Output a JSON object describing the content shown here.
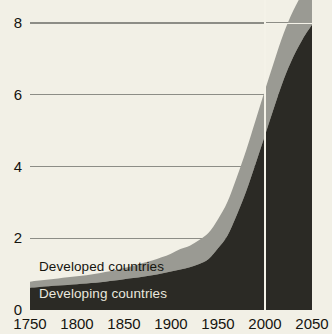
{
  "chart_data": {
    "type": "area",
    "stacked": true,
    "title": "",
    "subtitle": "",
    "xlabel": "",
    "ylabel": "",
    "xlim": [
      1750,
      2050
    ],
    "ylim": [
      0,
      8.7
    ],
    "grid": true,
    "grid_values": [
      2,
      4,
      6,
      8
    ],
    "legend_position": "inline",
    "xticks": [
      "1750",
      "1800",
      "1850",
      "1900",
      "1950",
      "2000",
      "2050"
    ],
    "xtick_values": [
      1750,
      1800,
      1850,
      1900,
      1950,
      2000,
      2050
    ],
    "yticks": [
      "0",
      "2",
      "4",
      "6",
      "8"
    ],
    "ytick_values": [
      0,
      2,
      4,
      6,
      8
    ],
    "annotation_line": {
      "x": 2000,
      "label": ""
    },
    "x": [
      1750,
      1760,
      1770,
      1780,
      1790,
      1800,
      1810,
      1820,
      1830,
      1840,
      1850,
      1860,
      1870,
      1880,
      1890,
      1900,
      1910,
      1920,
      1930,
      1940,
      1950,
      1960,
      1970,
      1980,
      1990,
      2000,
      2010,
      2020,
      2030,
      2040,
      2050
    ],
    "series": [
      {
        "name": "Developing countries",
        "color": "#2b2a25",
        "values": [
          0.62,
          0.64,
          0.66,
          0.68,
          0.7,
          0.72,
          0.74,
          0.76,
          0.79,
          0.82,
          0.86,
          0.89,
          0.93,
          0.97,
          1.02,
          1.07,
          1.13,
          1.19,
          1.28,
          1.42,
          1.72,
          2.07,
          2.65,
          3.31,
          4.08,
          4.87,
          5.67,
          6.43,
          7.05,
          7.55,
          7.95
        ]
      },
      {
        "name": "Developed countries",
        "color": "#9a9a93",
        "values": [
          0.17,
          0.18,
          0.19,
          0.2,
          0.21,
          0.22,
          0.23,
          0.25,
          0.27,
          0.29,
          0.31,
          0.34,
          0.38,
          0.41,
          0.45,
          0.5,
          0.57,
          0.6,
          0.67,
          0.73,
          0.81,
          0.94,
          1.05,
          1.14,
          1.21,
          1.26,
          1.28,
          1.29,
          1.29,
          1.28,
          1.26
        ]
      }
    ],
    "colors": {
      "background": "#f2f0e6",
      "developing": "#2b2a25",
      "developed": "#9a9a93",
      "grid": "#8d8d86",
      "text": "#15140f",
      "marker_line": "#f4f2e8"
    }
  }
}
